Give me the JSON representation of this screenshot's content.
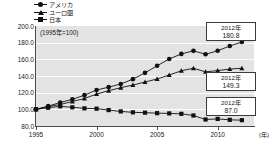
{
  "legend": {
    "items": [
      {
        "label": "アメリカ",
        "marker": "circle",
        "color": "#111111"
      },
      {
        "label": "ユーロ圏",
        "marker": "triangle",
        "color": "#111111"
      },
      {
        "label": "日本",
        "marker": "square",
        "color": "#111111"
      }
    ]
  },
  "base_note": "(1995年=100)",
  "x_unit_label": "(年)",
  "callouts": [
    {
      "year": "2012年",
      "value": "180.8",
      "series": "アメリカ"
    },
    {
      "year": "2012年",
      "value": "149.3",
      "series": "ユーロ圏"
    },
    {
      "year": "2012年",
      "value": "87.0",
      "series": "日本"
    }
  ],
  "chart_data": {
    "type": "line",
    "title": "",
    "subtitle": "(1995年=100)",
    "xlabel": "(年)",
    "ylabel": "",
    "xlim": [
      1995,
      2013
    ],
    "ylim": [
      80.0,
      200.0
    ],
    "ytick_labels": [
      "200.0",
      "180.0",
      "160.0",
      "140.0",
      "120.0",
      "100.0",
      "80.0"
    ],
    "ytick_values": [
      200.0,
      180.0,
      160.0,
      140.0,
      120.0,
      100.0,
      80.0
    ],
    "xtick_labels": [
      "1995",
      "2000",
      "2005",
      "2010"
    ],
    "xtick_values": [
      1995,
      2000,
      2005,
      2010
    ],
    "grid": true,
    "legend_position": "above-left",
    "x": [
      1995,
      1996,
      1997,
      1998,
      1999,
      2000,
      2001,
      2002,
      2003,
      2004,
      2005,
      2006,
      2007,
      2008,
      2009,
      2010,
      2011,
      2012
    ],
    "series": [
      {
        "name": "アメリカ",
        "marker": "circle",
        "color": "#111111",
        "values": [
          100.0,
          103.8,
          108.2,
          112.0,
          117.0,
          123.2,
          126.6,
          130.4,
          136.2,
          143.8,
          152.3,
          160.4,
          166.5,
          170.2,
          166.1,
          170.3,
          176.0,
          180.8
        ]
      },
      {
        "name": "ユーロ圏",
        "marker": "triangle",
        "color": "#111111",
        "values": [
          100.0,
          103.2,
          105.8,
          109.4,
          113.0,
          118.3,
          122.4,
          126.0,
          129.1,
          132.8,
          136.4,
          141.2,
          146.3,
          149.3,
          145.0,
          146.5,
          148.3,
          149.3
        ]
      },
      {
        "name": "日本",
        "marker": "square",
        "color": "#111111",
        "values": [
          100.0,
          101.9,
          103.6,
          102.4,
          101.2,
          100.8,
          99.1,
          97.5,
          96.4,
          96.0,
          95.4,
          95.1,
          94.6,
          92.6,
          87.8,
          88.5,
          87.4,
          87.0
        ]
      }
    ]
  }
}
